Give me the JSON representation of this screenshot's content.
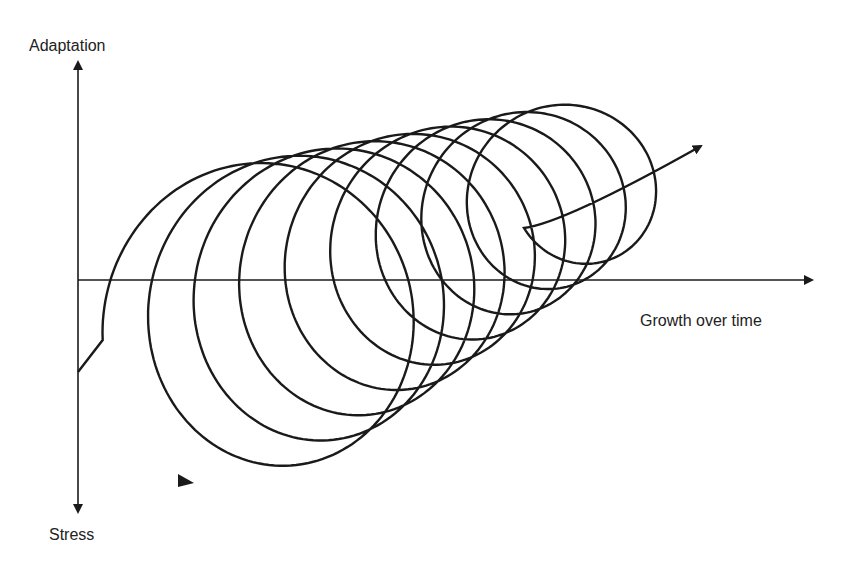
{
  "diagram": {
    "title": "",
    "labels": {
      "y_positive": "Adaptation",
      "y_negative": "Stress",
      "x_positive": "Growth over time"
    },
    "colors": {
      "background": "#ffffff",
      "stroke": "#1a1a1a",
      "text": "#222222"
    },
    "axes": {
      "origin": [
        78,
        280
      ],
      "y_top": [
        78,
        62
      ],
      "y_bottom": [
        78,
        512
      ],
      "x_end": [
        812,
        280
      ]
    },
    "spiral": {
      "description": "Upward spiral of stress-adaptation cycles growing over time",
      "start_point": [
        78,
        372
      ],
      "loop_count": 9,
      "center_start": [
        250,
        325
      ],
      "center_end": [
        588,
        180
      ],
      "radius_x_start": 148,
      "radius_x_end": 80,
      "radius_y_start": 160,
      "radius_y_end": 80,
      "end_arrow_tip": [
        701,
        146
      ],
      "start_arrow_position": [
        190,
        481
      ]
    }
  }
}
